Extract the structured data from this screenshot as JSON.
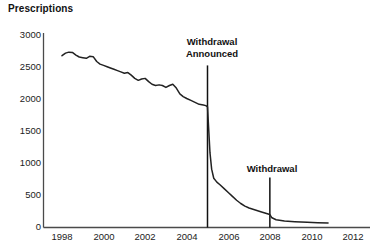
{
  "chart_data": {
    "type": "line",
    "title": "Prescriptions",
    "xlabel": "",
    "ylabel": "Prescriptions",
    "grid": false,
    "legend": "none",
    "xlim": [
      1997.0,
      2012.5
    ],
    "ylim": [
      0,
      3000
    ],
    "yticks": [
      0,
      500,
      1000,
      1500,
      2000,
      2500,
      3000
    ],
    "ytick_labels": [
      "0",
      "500",
      "1000",
      "1500",
      "2000",
      "2500",
      "3000"
    ],
    "xticks": [
      1998,
      2000,
      2002,
      2004,
      2006,
      2008,
      2010,
      2012
    ],
    "xtick_labels": [
      "1998",
      "2000",
      "2002",
      "2004",
      "2006",
      "2008",
      "2010",
      "2012"
    ],
    "series": [
      {
        "name": "Prescriptions",
        "color": "#222222",
        "x": [
          1998.0,
          1998.17,
          1998.33,
          1998.5,
          1998.67,
          1998.83,
          1999.0,
          1999.17,
          1999.33,
          1999.5,
          1999.67,
          1999.83,
          2000.0,
          2000.17,
          2000.33,
          2000.5,
          2000.67,
          2000.83,
          2001.0,
          2001.17,
          2001.33,
          2001.5,
          2001.67,
          2001.83,
          2002.0,
          2002.17,
          2002.33,
          2002.5,
          2002.67,
          2002.83,
          2003.0,
          2003.17,
          2003.33,
          2003.5,
          2003.67,
          2003.83,
          2004.0,
          2004.2,
          2004.4,
          2004.6,
          2004.8,
          2004.92,
          2005.0,
          2005.06,
          2005.12,
          2005.2,
          2005.3,
          2005.45,
          2005.6,
          2005.8,
          2006.0,
          2006.2,
          2006.4,
          2006.6,
          2006.8,
          2007.0,
          2007.3,
          2007.6,
          2008.0,
          2008.1,
          2008.3,
          2008.7,
          2009.2,
          2009.8,
          2010.3,
          2010.8
        ],
        "y": [
          2650,
          2690,
          2705,
          2700,
          2660,
          2630,
          2620,
          2610,
          2640,
          2635,
          2560,
          2520,
          2500,
          2480,
          2460,
          2440,
          2420,
          2400,
          2380,
          2390,
          2350,
          2300,
          2270,
          2290,
          2300,
          2250,
          2210,
          2190,
          2200,
          2190,
          2160,
          2190,
          2210,
          2150,
          2060,
          2020,
          1990,
          1960,
          1930,
          1900,
          1890,
          1880,
          1860,
          1500,
          1150,
          900,
          760,
          700,
          660,
          600,
          540,
          480,
          420,
          370,
          330,
          300,
          270,
          240,
          200,
          150,
          120,
          100,
          90,
          80,
          75,
          70
        ]
      }
    ],
    "annotations": [
      {
        "label": "Withdrawal\nAnnounced",
        "line1": "Withdrawal",
        "line2": "Announced",
        "x": 2005.0,
        "y_top": 2500,
        "y_bottom": 0
      },
      {
        "label": "Withdrawal",
        "line1": "Withdrawal",
        "line2": "",
        "x": 2008.0,
        "y_top": 770,
        "y_bottom": 0
      }
    ]
  },
  "colors": {
    "axis": "#4a4a4a",
    "line": "#222222",
    "marker": "#111111",
    "text": "#1a1a1a",
    "background": "#ffffff"
  },
  "axes": {
    "y_tick_labels": [
      "3000",
      "2500",
      "2000",
      "1500",
      "1000",
      "500",
      "0"
    ],
    "x_tick_labels": [
      "1998",
      "2000",
      "2002",
      "2004",
      "2006",
      "2008",
      "2010",
      "2012"
    ]
  },
  "annotations_text": {
    "withdrawal_announced_line1": "Withdrawal",
    "withdrawal_announced_line2": "Announced",
    "withdrawal_line1": "Withdrawal"
  }
}
